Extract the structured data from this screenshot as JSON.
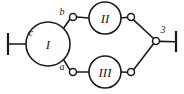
{
  "diagram": {
    "type": "graph-network-diagram",
    "background_color": "#ffffff",
    "stroke_color": "#1a1a1a",
    "node_fill_color": "#ffffff",
    "main_nodes": [
      {
        "id": "node-1",
        "label": "I",
        "cx": 48,
        "cy": 44,
        "r": 22
      },
      {
        "id": "node-2",
        "label": "II",
        "cx": 105,
        "cy": 18,
        "r": 16
      },
      {
        "id": "node-3",
        "label": "III",
        "cx": 105,
        "cy": 72,
        "r": 16
      }
    ],
    "junction_nodes": [
      {
        "id": "junction-b",
        "cx": 73,
        "cy": 17,
        "r": 3.5
      },
      {
        "id": "junction-a",
        "cx": 73,
        "cy": 72,
        "r": 3.5
      },
      {
        "id": "junction-top-right",
        "cx": 131,
        "cy": 17,
        "r": 3.5
      },
      {
        "id": "junction-bottom-right",
        "cx": 131,
        "cy": 72,
        "r": 3.5
      },
      {
        "id": "junction-right",
        "cx": 156,
        "cy": 41,
        "r": 3.5
      }
    ],
    "edge_labels": [
      {
        "id": "label-c",
        "text": "c",
        "x": 31,
        "y": 36
      },
      {
        "id": "label-b",
        "text": "b",
        "x": 62,
        "y": 15
      },
      {
        "id": "label-a",
        "text": "a",
        "x": 62,
        "y": 70
      },
      {
        "id": "label-3",
        "text": "3",
        "x": 163,
        "y": 33
      }
    ],
    "terminals": [
      {
        "id": "terminal-left",
        "x": 8,
        "y_top": 33,
        "y_bottom": 55
      },
      {
        "id": "terminal-right",
        "x": 176,
        "y_top": 31,
        "y_bottom": 52
      }
    ],
    "edges": [
      {
        "id": "edge-left-lead",
        "d": "M 8 44 L 26 44"
      },
      {
        "id": "edge-node1-to-b",
        "d": "M 63.5 28.5 L 70.2 18.8"
      },
      {
        "id": "edge-b-to-node2",
        "d": "M 76.5 17 L 89 18"
      },
      {
        "id": "edge-node1-to-a",
        "d": "M 63.5 59.5 L 70.2 70.4"
      },
      {
        "id": "edge-a-to-node3",
        "d": "M 76.5 72 L 89 72"
      },
      {
        "id": "edge-node2-to-tr",
        "d": "M 121 18 L 127.6 17.3"
      },
      {
        "id": "edge-tr-to-junction",
        "d": "M 133.5 19.8 L 153.6 38.5"
      },
      {
        "id": "edge-node3-to-br",
        "d": "M 121 72 L 127.6 72.3"
      },
      {
        "id": "edge-br-to-junction",
        "d": "M 133.6 69.8 L 153.7 43.6"
      },
      {
        "id": "edge-right-lead",
        "d": "M 159.5 41.4 L 176 41.8"
      }
    ]
  }
}
